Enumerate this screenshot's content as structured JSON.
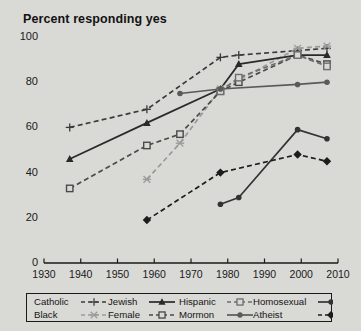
{
  "chart_data": {
    "type": "line",
    "title": "Percent responding yes",
    "xlabel": "",
    "ylabel": "",
    "xlim": [
      1930,
      2010
    ],
    "ylim": [
      0,
      100
    ],
    "xticks": [
      1930,
      1940,
      1950,
      1960,
      1970,
      1980,
      1990,
      2000,
      2010
    ],
    "yticks": [
      0,
      20,
      40,
      60,
      80,
      100
    ],
    "grid": false,
    "legend_position": "below",
    "series": [
      {
        "name": "Catholic",
        "line": "dashed",
        "marker": "plus",
        "color": "#3a3a3a",
        "x": [
          1937,
          1958,
          1978,
          1983,
          1999,
          2007
        ],
        "y": [
          60,
          68,
          91,
          92,
          94,
          95
        ]
      },
      {
        "name": "Black",
        "line": "dashed",
        "marker": "asterisk",
        "color": "#9a9a9a",
        "x": [
          1958,
          1967,
          1978,
          1983,
          1999,
          2007
        ],
        "y": [
          37,
          53,
          77,
          81,
          95,
          96
        ]
      },
      {
        "name": "Jewish",
        "line": "solid",
        "marker": "triangle",
        "color": "#2a2a2a",
        "x": [
          1937,
          1958,
          1978,
          1983,
          1999,
          2007
        ],
        "y": [
          46,
          62,
          77,
          88,
          92,
          92
        ]
      },
      {
        "name": "Female",
        "line": "dashed",
        "marker": "square",
        "color": "#4a4a4a",
        "x": [
          1937,
          1958,
          1967,
          1978,
          1983,
          1999,
          2007
        ],
        "y": [
          33,
          52,
          57,
          76,
          80,
          92,
          88
        ]
      },
      {
        "name": "Hispanic",
        "line": "dashed",
        "marker": "square",
        "color": "#6e6e6e",
        "x": [
          1978,
          1983,
          1999,
          2007
        ],
        "y": [
          76,
          82,
          92,
          87
        ]
      },
      {
        "name": "Mormon",
        "line": "solid",
        "marker": "circle",
        "color": "#5a5a5a",
        "x": [
          1967,
          1978,
          1999,
          2007
        ],
        "y": [
          75,
          77,
          79,
          80
        ]
      },
      {
        "name": "Homosexual",
        "line": "solid",
        "marker": "circle",
        "color": "#333333",
        "x": [
          1978,
          1983,
          1999,
          2007
        ],
        "y": [
          26,
          29,
          59,
          55
        ]
      },
      {
        "name": "Atheist",
        "line": "dashed",
        "marker": "diamond",
        "color": "#1c1c1c",
        "x": [
          1958,
          1978,
          1999,
          2007
        ],
        "y": [
          19,
          40,
          48,
          45
        ]
      }
    ]
  },
  "legend": {
    "entries": [
      {
        "label": "Catholic"
      },
      {
        "label": "Jewish"
      },
      {
        "label": "Hispanic"
      },
      {
        "label": "Homosexual"
      },
      {
        "label": "Black"
      },
      {
        "label": "Female"
      },
      {
        "label": "Mormon"
      },
      {
        "label": "Atheist"
      }
    ]
  },
  "axes": {
    "y_tick_labels": [
      "100",
      "80",
      "60",
      "40",
      "20",
      "0"
    ],
    "x_tick_labels": [
      "1930",
      "1940",
      "1950",
      "1960",
      "1970",
      "1980",
      "1990",
      "2000",
      "2010"
    ]
  }
}
